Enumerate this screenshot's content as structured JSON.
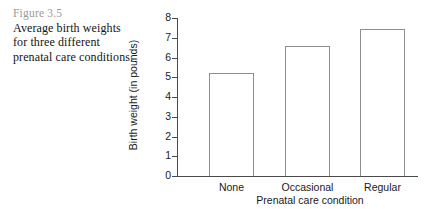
{
  "caption": {
    "figure_label": "Figure 3.5",
    "text": "Average birth weights for three different prenatal care conditions."
  },
  "chart_data": {
    "type": "bar",
    "title": "",
    "categories": [
      "None",
      "Occasional",
      "Regular"
    ],
    "values": [
      5.2,
      6.6,
      7.45
    ],
    "xlabel": "Prenatal care condition",
    "ylabel": "Birth weight (in pounds)",
    "ylim": [
      0,
      8
    ],
    "yticks": [
      0,
      1,
      2,
      3,
      4,
      5,
      6,
      7,
      8
    ],
    "ytick_labels": [
      "0",
      "1",
      "2",
      "3",
      "4",
      "5",
      "6",
      "7",
      "8"
    ],
    "grid": false,
    "legend": false,
    "bar_fill_color": "#ffffff",
    "bar_edge_color": "#8d8d8d",
    "axis_color": "#4a4a4a"
  }
}
